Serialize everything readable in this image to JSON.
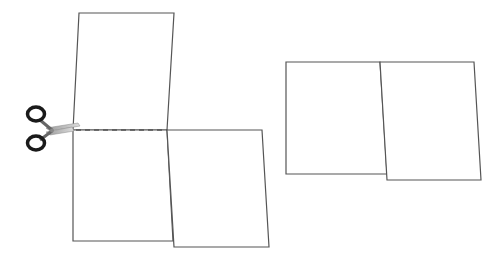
{
  "diagram": {
    "description": "Paper folding/cutting puzzle: an unfolded paper shape with scissors cutting along a dashed line, and the resulting shape",
    "stroke_color": "#555555",
    "dash_color": "#555555",
    "icons": {
      "scissors": "scissors-icon"
    },
    "left_figure": {
      "upper_panel": [
        [
          79,
          13
        ],
        [
          174,
          13
        ],
        [
          167,
          130
        ],
        [
          73,
          130
        ]
      ],
      "lower_left_panel": [
        [
          73,
          130
        ],
        [
          167,
          130
        ],
        [
          173,
          241
        ],
        [
          73,
          241
        ]
      ],
      "lower_right_panel": [
        [
          167,
          130
        ],
        [
          262,
          130
        ],
        [
          269,
          247
        ],
        [
          174,
          247
        ]
      ],
      "cut_line": {
        "x1": 76,
        "y1": 130,
        "x2": 167,
        "y2": 130
      }
    },
    "right_figure": {
      "left_panel": [
        [
          286,
          62
        ],
        [
          380,
          62
        ],
        [
          387,
          174
        ],
        [
          286,
          174
        ]
      ],
      "right_panel": [
        [
          380,
          62
        ],
        [
          474,
          62
        ],
        [
          481,
          180
        ],
        [
          387,
          180
        ]
      ]
    }
  }
}
